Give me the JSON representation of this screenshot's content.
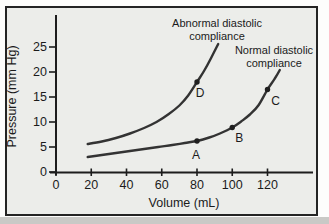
{
  "figure": {
    "outer_bg": "#fdfdfc",
    "panel_bg": "#ecedea",
    "border_color": "#242424",
    "axis_color": "#1d1d1d",
    "curve_color": "#333333",
    "marker_color": "#1f1f1f",
    "text_color": "#1b1b1b",
    "shadow_color": "#c9c9c6"
  },
  "chart_data": {
    "type": "line",
    "xlabel": "Volume (mL)",
    "ylabel": "Pressure (mm Hg)",
    "xlim": [
      0,
      145
    ],
    "ylim": [
      0,
      31
    ],
    "xticks": [
      0,
      20,
      40,
      60,
      80,
      100,
      120
    ],
    "yticks": [
      0,
      5,
      10,
      15,
      20,
      25
    ],
    "grid": false,
    "legend_position": "inline-annotations",
    "series": [
      {
        "name": "Abnormal diastolic compliance",
        "label_lines": [
          "Abnormal diastolic",
          "compliance"
        ],
        "points": [
          [
            18,
            5.6
          ],
          [
            26,
            6.1
          ],
          [
            34,
            6.8
          ],
          [
            42,
            7.7
          ],
          [
            50,
            8.8
          ],
          [
            57,
            10.0
          ],
          [
            64,
            11.6
          ],
          [
            70,
            13.3
          ],
          [
            75,
            15.3
          ],
          [
            80,
            18.0
          ],
          [
            84,
            20.2
          ],
          [
            88,
            22.8
          ],
          [
            92,
            25.6
          ]
        ]
      },
      {
        "name": "Normal diastolic compliance",
        "label_lines": [
          "Normal diastolic",
          "compliance"
        ],
        "points": [
          [
            18,
            3.0
          ],
          [
            26,
            3.4
          ],
          [
            34,
            3.8
          ],
          [
            42,
            4.2
          ],
          [
            50,
            4.6
          ],
          [
            58,
            5.0
          ],
          [
            66,
            5.4
          ],
          [
            73,
            5.8
          ],
          [
            80,
            6.2
          ],
          [
            87,
            6.9
          ],
          [
            93,
            7.7
          ],
          [
            100,
            8.9
          ],
          [
            105,
            10.1
          ],
          [
            110,
            11.5
          ],
          [
            115,
            13.4
          ],
          [
            120,
            16.5
          ],
          [
            124,
            18.6
          ],
          [
            127,
            20.4
          ]
        ]
      }
    ],
    "markers": [
      {
        "label": "A",
        "x": 80,
        "y": 6.2,
        "series": "Normal diastolic compliance"
      },
      {
        "label": "B",
        "x": 100,
        "y": 8.9,
        "series": "Normal diastolic compliance"
      },
      {
        "label": "C",
        "x": 120,
        "y": 16.5,
        "series": "Normal diastolic compliance"
      },
      {
        "label": "D",
        "x": 80,
        "y": 18.0,
        "series": "Abnormal diastolic compliance"
      }
    ]
  }
}
